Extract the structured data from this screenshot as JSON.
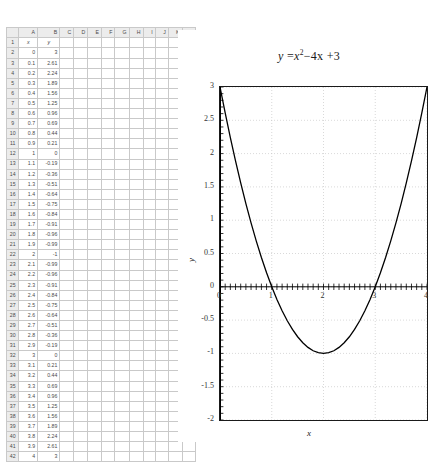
{
  "spreadsheet": {
    "column_headers": [
      "A",
      "B",
      "C",
      "D",
      "E",
      "F",
      "G",
      "H",
      "I",
      "J",
      "K",
      "L"
    ],
    "header_row": {
      "a": "x",
      "b": "y"
    },
    "row_numbers": [
      1,
      2,
      3,
      4,
      5,
      6,
      7,
      8,
      9,
      10,
      11,
      12,
      13,
      14,
      15,
      16,
      17,
      18,
      19,
      20,
      21,
      22,
      23,
      24,
      25,
      26,
      27,
      28,
      29,
      30,
      31,
      32,
      33,
      34,
      35,
      36,
      37,
      38,
      39,
      40,
      41,
      42
    ],
    "rows": [
      {
        "n": 2,
        "x": "0",
        "y": "3"
      },
      {
        "n": 3,
        "x": "0.1",
        "y": "2.61"
      },
      {
        "n": 4,
        "x": "0.2",
        "y": "2.24"
      },
      {
        "n": 5,
        "x": "0.3",
        "y": "1.89"
      },
      {
        "n": 6,
        "x": "0.4",
        "y": "1.56"
      },
      {
        "n": 7,
        "x": "0.5",
        "y": "1.25"
      },
      {
        "n": 8,
        "x": "0.6",
        "y": "0.96"
      },
      {
        "n": 9,
        "x": "0.7",
        "y": "0.69"
      },
      {
        "n": 10,
        "x": "0.8",
        "y": "0.44"
      },
      {
        "n": 11,
        "x": "0.9",
        "y": "0.21"
      },
      {
        "n": 12,
        "x": "1",
        "y": "0"
      },
      {
        "n": 13,
        "x": "1.1",
        "y": "-0.19"
      },
      {
        "n": 14,
        "x": "1.2",
        "y": "-0.36"
      },
      {
        "n": 15,
        "x": "1.3",
        "y": "-0.51"
      },
      {
        "n": 16,
        "x": "1.4",
        "y": "-0.64"
      },
      {
        "n": 17,
        "x": "1.5",
        "y": "-0.75"
      },
      {
        "n": 18,
        "x": "1.6",
        "y": "-0.84"
      },
      {
        "n": 19,
        "x": "1.7",
        "y": "-0.91"
      },
      {
        "n": 20,
        "x": "1.8",
        "y": "-0.96"
      },
      {
        "n": 21,
        "x": "1.9",
        "y": "-0.99"
      },
      {
        "n": 22,
        "x": "2",
        "y": "-1"
      },
      {
        "n": 23,
        "x": "2.1",
        "y": "-0.99"
      },
      {
        "n": 24,
        "x": "2.2",
        "y": "-0.96"
      },
      {
        "n": 25,
        "x": "2.3",
        "y": "-0.91"
      },
      {
        "n": 26,
        "x": "2.4",
        "y": "-0.84"
      },
      {
        "n": 27,
        "x": "2.5",
        "y": "-0.75"
      },
      {
        "n": 28,
        "x": "2.6",
        "y": "-0.64"
      },
      {
        "n": 29,
        "x": "2.7",
        "y": "-0.51"
      },
      {
        "n": 30,
        "x": "2.8",
        "y": "-0.36"
      },
      {
        "n": 31,
        "x": "2.9",
        "y": "-0.19"
      },
      {
        "n": 32,
        "x": "3",
        "y": "0"
      },
      {
        "n": 33,
        "x": "3.1",
        "y": "0.21"
      },
      {
        "n": 34,
        "x": "3.2",
        "y": "0.44"
      },
      {
        "n": 35,
        "x": "3.3",
        "y": "0.69"
      },
      {
        "n": 36,
        "x": "3.4",
        "y": "0.96"
      },
      {
        "n": 37,
        "x": "3.5",
        "y": "1.25"
      },
      {
        "n": 38,
        "x": "3.6",
        "y": "1.56"
      },
      {
        "n": 39,
        "x": "3.7",
        "y": "1.89"
      },
      {
        "n": 40,
        "x": "3.8",
        "y": "2.24"
      },
      {
        "n": 41,
        "x": "3.9",
        "y": "2.61"
      },
      {
        "n": 42,
        "x": "4",
        "y": "3"
      }
    ]
  },
  "chart_title": {
    "lhs": "y",
    "eq": " =",
    "term1": "x",
    "exp": "2",
    "rest": "−4x +3"
  },
  "chart_data": {
    "type": "line",
    "xlabel": "x",
    "ylabel": "y",
    "xlim": [
      0,
      4
    ],
    "ylim": [
      -2,
      3
    ],
    "grid": true,
    "legend": "none",
    "xticks": [
      "0",
      "1",
      "2",
      "3",
      "4"
    ],
    "yticks": [
      "3",
      "2.5",
      "2",
      "1.5",
      "1",
      "0.5",
      "0",
      "-0.5",
      "-1",
      "-1.5",
      "-2"
    ],
    "x": [
      0,
      0.1,
      0.2,
      0.3,
      0.4,
      0.5,
      0.6,
      0.7,
      0.8,
      0.9,
      1,
      1.1,
      1.2,
      1.3,
      1.4,
      1.5,
      1.6,
      1.7,
      1.8,
      1.9,
      2,
      2.1,
      2.2,
      2.3,
      2.4,
      2.5,
      2.6,
      2.7,
      2.8,
      2.9,
      3,
      3.1,
      3.2,
      3.3,
      3.4,
      3.5,
      3.6,
      3.7,
      3.8,
      3.9,
      4
    ],
    "y": [
      3,
      2.61,
      2.24,
      1.89,
      1.56,
      1.25,
      0.96,
      0.69,
      0.44,
      0.21,
      0,
      -0.19,
      -0.36,
      -0.51,
      -0.64,
      -0.75,
      -0.84,
      -0.91,
      -0.96,
      -0.99,
      -1,
      -0.99,
      -0.96,
      -0.91,
      -0.84,
      -0.75,
      -0.64,
      -0.51,
      -0.36,
      -0.19,
      0,
      0.21,
      0.44,
      0.69,
      0.96,
      1.25,
      1.56,
      1.89,
      2.24,
      2.61,
      3
    ],
    "series_color": "#000000"
  }
}
